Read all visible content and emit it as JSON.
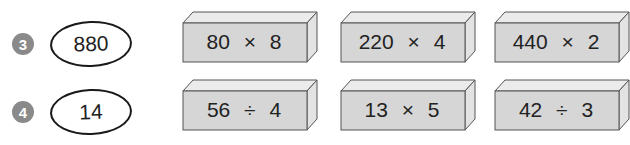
{
  "problems": [
    {
      "number": "3",
      "answer": "880",
      "boxes": [
        {
          "expression": "80 × 8"
        },
        {
          "expression": "220 × 4"
        },
        {
          "expression": "440 × 2"
        }
      ]
    },
    {
      "number": "4",
      "answer": "14",
      "boxes": [
        {
          "expression": "56 ÷ 4"
        },
        {
          "expression": "13 × 5"
        },
        {
          "expression": "42 ÷ 3"
        }
      ]
    }
  ],
  "colors": {
    "badge": "#8a8a8a",
    "box_front": "#d6d6d6",
    "box_top": "#ebebeb",
    "box_side": "#e3e3e3",
    "outline": "#555555"
  }
}
